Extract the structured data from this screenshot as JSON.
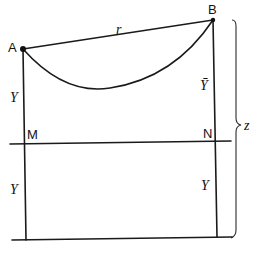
{
  "diagram": {
    "type": "geometry",
    "points": {
      "A": {
        "label": "A",
        "x": 23,
        "y": 49
      },
      "B": {
        "label": "B",
        "x": 213,
        "y": 20
      },
      "M": {
        "label": "M",
        "x": 25,
        "y": 143
      },
      "N": {
        "label": "N",
        "x": 216,
        "y": 142
      }
    },
    "labels": {
      "chord": "r",
      "left_upper": "Y",
      "right_upper": "Ȳ",
      "left_lower": "Y",
      "right_lower": "Y",
      "brace": "z"
    },
    "colors": {
      "stroke": "#1a1a1a",
      "background": "#ffffff"
    }
  }
}
